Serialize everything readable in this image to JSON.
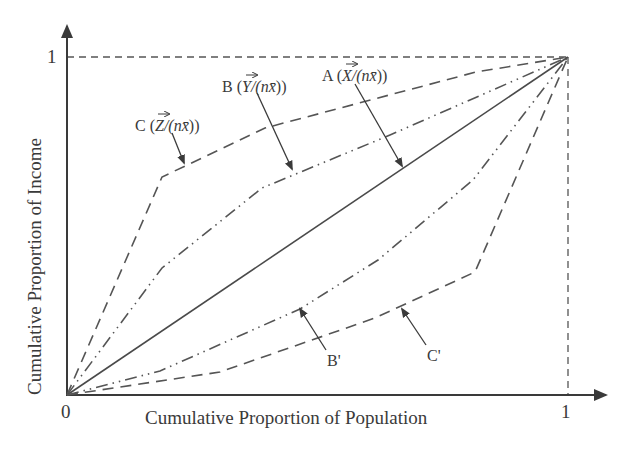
{
  "figure": {
    "type": "lorenz-curve-diagram",
    "axes": {
      "x_label": "Cumulative Proportion of Population",
      "y_label": "Cumulative Proportion of Income",
      "origin_label": "0",
      "x_max_label": "1",
      "y_max_label": "1"
    },
    "curves": [
      {
        "id": "A",
        "label": "A (X⃗/(nx̄))",
        "style": "solid",
        "description": "line of equality",
        "points": [
          [
            0,
            0
          ],
          [
            1,
            1
          ]
        ]
      },
      {
        "id": "B",
        "label": "B (Y⃗/(nx̄))",
        "style": "dash-dot-dot",
        "points": [
          [
            0,
            0
          ],
          [
            0.19,
            0.38
          ],
          [
            0.39,
            0.61
          ],
          [
            0.65,
            0.77
          ],
          [
            1,
            1
          ]
        ]
      },
      {
        "id": "C",
        "label": "C (Z⃗/(nx̄))",
        "style": "dashed",
        "points": [
          [
            0,
            0
          ],
          [
            0.19,
            0.65
          ],
          [
            0.395,
            0.79
          ],
          [
            0.82,
            0.96
          ],
          [
            1,
            1
          ]
        ]
      },
      {
        "id": "B'",
        "label": "B'",
        "style": "dash-dot-dot",
        "points": [
          [
            0,
            0
          ],
          [
            0.19,
            0.07
          ],
          [
            0.465,
            0.255
          ],
          [
            0.62,
            0.4
          ],
          [
            0.81,
            0.635
          ],
          [
            1,
            1
          ]
        ]
      },
      {
        "id": "C'",
        "label": "C'",
        "style": "dashed",
        "points": [
          [
            0,
            0
          ],
          [
            0.305,
            0.07
          ],
          [
            0.615,
            0.23
          ],
          [
            0.81,
            0.365
          ],
          [
            1,
            1
          ]
        ]
      }
    ]
  },
  "labels": {
    "curve_a_prefix": "A (",
    "curve_a_var": "X",
    "curve_a_suffix": "/(n",
    "curve_a_xbar": "x̄",
    "curve_a_close": "))",
    "curve_b_prefix": "B (",
    "curve_b_var": "Y",
    "curve_b_suffix": "/(n",
    "curve_b_xbar": "x̄",
    "curve_b_close": "))",
    "curve_c_prefix": "C (",
    "curve_c_var": "Z",
    "curve_c_suffix": "/(n",
    "curve_c_xbar": "x̄",
    "curve_c_close": "))",
    "curve_b_prime": "B'",
    "curve_c_prime": "C'"
  },
  "colors": {
    "ink": "#3a3a3a",
    "background": "#ffffff"
  }
}
